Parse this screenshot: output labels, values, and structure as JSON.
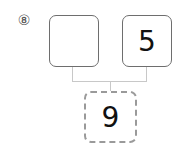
{
  "problem": {
    "number_label": "⑧",
    "top_left_value": "",
    "top_right_value": "5",
    "bottom_value": "9"
  }
}
